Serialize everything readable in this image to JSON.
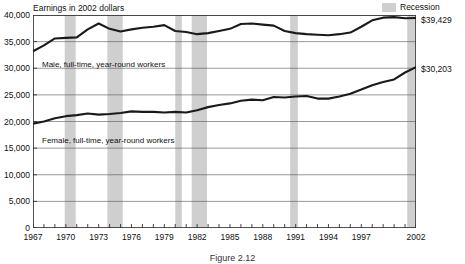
{
  "legend": {
    "recession_label": "Recession",
    "recession_color": "#cfcfcf"
  },
  "axis_title": "Earnings in 2002 dollars",
  "caption": "Figure 2.12",
  "end_labels": {
    "male": "$39,429",
    "female": "$30,203"
  },
  "series_labels": {
    "male": "Male, full-time, year-round workers",
    "female": "Female, full-time, year-round workers"
  },
  "chart_data": {
    "type": "line",
    "title": "Earnings in 2002 dollars",
    "xlabel": "",
    "ylabel": "Earnings in 2002 dollars",
    "ylim": [
      0,
      40000
    ],
    "yticks": [
      0,
      5000,
      10000,
      15000,
      20000,
      25000,
      30000,
      35000,
      40000
    ],
    "ytick_labels": [
      "0",
      "5,000",
      "10,000",
      "15,000",
      "20,000",
      "25,000",
      "30,000",
      "35,000",
      "40,000"
    ],
    "xlim": [
      1967,
      2002
    ],
    "xticks": [
      1967,
      1970,
      1973,
      1976,
      1979,
      1982,
      1985,
      1988,
      1991,
      1994,
      1997,
      2002
    ],
    "xtick_labels": [
      "1967",
      "1970",
      "1973",
      "1976",
      "1979",
      "1982",
      "1985",
      "1988",
      "1991",
      "1994",
      "1997",
      "2002"
    ],
    "grid": true,
    "legend_position": "top-right",
    "line_color": "#1a1a1a",
    "x": [
      1967,
      1968,
      1969,
      1970,
      1971,
      1972,
      1973,
      1974,
      1975,
      1976,
      1977,
      1978,
      1979,
      1980,
      1981,
      1982,
      1983,
      1984,
      1985,
      1986,
      1987,
      1988,
      1989,
      1990,
      1991,
      1992,
      1993,
      1994,
      1995,
      1996,
      1997,
      1998,
      1999,
      2000,
      2001,
      2002
    ],
    "series": [
      {
        "name": "Male, full-time, year-round workers",
        "end_value": 39429,
        "values": [
          33200,
          34300,
          35600,
          35700,
          35800,
          37300,
          38400,
          37400,
          36900,
          37300,
          37600,
          37800,
          38100,
          37000,
          36800,
          36400,
          36600,
          37000,
          37400,
          38300,
          38400,
          38200,
          38000,
          37000,
          36600,
          36400,
          36300,
          36200,
          36400,
          36700,
          37800,
          39000,
          39500,
          39600,
          39400,
          39429
        ]
      },
      {
        "name": "Female, full-time, year-round workers",
        "end_value": 30203,
        "values": [
          19600,
          20000,
          20600,
          21000,
          21200,
          21500,
          21300,
          21400,
          21600,
          21900,
          21800,
          21800,
          21700,
          21800,
          21700,
          22100,
          22700,
          23100,
          23400,
          23900,
          24100,
          24000,
          24600,
          24500,
          24700,
          24800,
          24300,
          24300,
          24700,
          25200,
          26000,
          26800,
          27400,
          27900,
          29200,
          30203
        ]
      }
    ],
    "recessions": [
      {
        "start": 1969.9,
        "end": 1970.9
      },
      {
        "start": 1973.8,
        "end": 1975.2
      },
      {
        "start": 1980.0,
        "end": 1980.6
      },
      {
        "start": 1981.5,
        "end": 1982.9
      },
      {
        "start": 1990.5,
        "end": 1991.2
      },
      {
        "start": 2001.2,
        "end": 2001.9
      }
    ]
  }
}
